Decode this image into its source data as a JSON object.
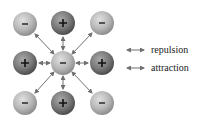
{
  "diagram": {
    "ions": [
      {
        "id": "tl",
        "charge": "-",
        "x": 25,
        "y": 24
      },
      {
        "id": "tc",
        "charge": "+",
        "x": 63,
        "y": 23
      },
      {
        "id": "tr",
        "charge": "-",
        "x": 102,
        "y": 23
      },
      {
        "id": "ml",
        "charge": "+",
        "x": 25,
        "y": 63
      },
      {
        "id": "mc",
        "charge": "-",
        "x": 63,
        "y": 63
      },
      {
        "id": "mr",
        "charge": "+",
        "x": 102,
        "y": 63
      },
      {
        "id": "bl",
        "charge": "-",
        "x": 25,
        "y": 103
      },
      {
        "id": "bc",
        "charge": "+",
        "x": 63,
        "y": 103
      },
      {
        "id": "br",
        "charge": "-",
        "x": 102,
        "y": 103
      }
    ],
    "colors": {
      "negative_ion": "#b4b4b4",
      "positive_ion": "#7a7a7a",
      "arrow": "#707070"
    }
  },
  "legend": {
    "repulsion_label": "repulsion",
    "attraction_label": "attraction"
  }
}
